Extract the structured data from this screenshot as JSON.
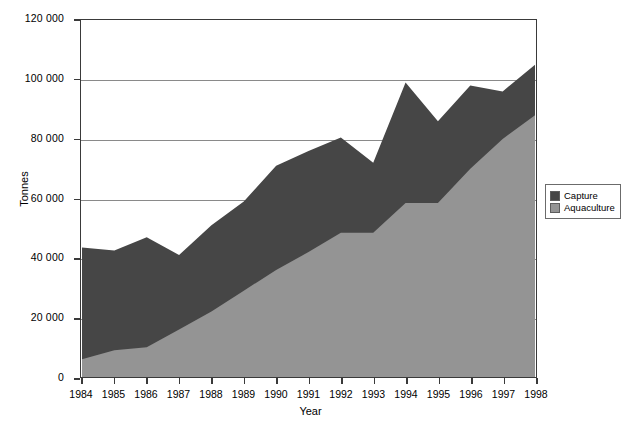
{
  "chart_data": {
    "type": "area",
    "title": "",
    "xlabel": "Year",
    "ylabel": "Tonnes",
    "grid": true,
    "stacked": true,
    "legend_position": "right",
    "xlim": [
      1984,
      1998
    ],
    "ylim": [
      0,
      120000
    ],
    "ytick_labels": [
      "120 000",
      "100 000",
      "80 000",
      "60 000",
      "40 000",
      "20 000",
      "0"
    ],
    "ytick_values": [
      120000,
      100000,
      80000,
      60000,
      40000,
      20000,
      0
    ],
    "categories": [
      1984,
      1985,
      1986,
      1987,
      1988,
      1989,
      1990,
      1991,
      1992,
      1993,
      1994,
      1995,
      1996,
      1997,
      1998
    ],
    "xtick_labels": [
      "1984",
      "1985",
      "1986",
      "1987",
      "1988",
      "1989",
      "1990",
      "1991",
      "1992",
      "1993",
      "1994",
      "1995",
      "1996",
      "1997",
      "1998"
    ],
    "series": [
      {
        "name": "Aquaculture",
        "color": "#949494",
        "values": [
          6000,
          9000,
          10000,
          16000,
          22000,
          29000,
          36000,
          42000,
          48500,
          48500,
          58500,
          58500,
          70000,
          80000,
          88000
        ]
      },
      {
        "name": "Capture",
        "color": "#464646",
        "values": [
          37500,
          33500,
          37000,
          25000,
          29000,
          30000,
          35000,
          34000,
          32000,
          23500,
          40500,
          27500,
          28000,
          16000,
          17000
        ]
      }
    ],
    "totals": [
      43500,
      42500,
      47000,
      41000,
      51000,
      59000,
      71000,
      76000,
      80500,
      72000,
      99000,
      86000,
      98000,
      96000,
      105000
    ]
  },
  "legend": {
    "items": [
      {
        "label": "Capture",
        "color": "#464646"
      },
      {
        "label": "Aquaculture",
        "color": "#949494"
      }
    ]
  },
  "axes": {
    "y_title": "Tonnes",
    "x_title": "Year"
  }
}
